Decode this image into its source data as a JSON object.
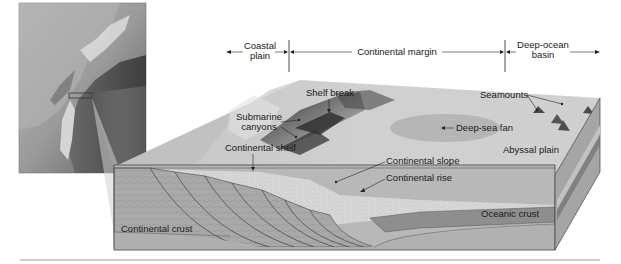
{
  "diagram": {
    "type": "block-diagram",
    "inset_map": {
      "description": "shaded relief map of coastline with highlighted rectangle"
    },
    "zones": [
      {
        "label_line1": "Coastal",
        "label_line2": "plain"
      },
      {
        "label_line1": "Continental margin",
        "label_line2": ""
      },
      {
        "label_line1": "Deep-ocean",
        "label_line2": "basin"
      }
    ],
    "labels": {
      "shelf_break": "Shelf break",
      "submarine_canyons_1": "Submarine",
      "submarine_canyons_2": "canyons",
      "continental_shelf": "Continental shelf",
      "continental_slope": "Continental slope",
      "continental_rise": "Continental rise",
      "deep_sea_fan": "Deep-sea fan",
      "seamounts": "Seamounts",
      "abyssal_plain": "Abyssal plain",
      "oceanic_crust": "Oceanic crust",
      "continental_crust": "Continental crust"
    },
    "colors": {
      "surface": "#c9c9c9",
      "crust": "#a8a8a8",
      "sediment": "#d8d8d8",
      "oceanic_crust": "#8f8f8f",
      "mantle": "#b5b5b5",
      "dark_relief": "#3a3a3a"
    }
  }
}
